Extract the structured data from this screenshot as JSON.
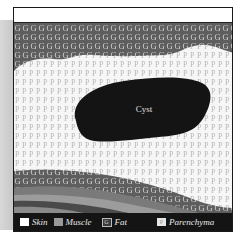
{
  "diagram": {
    "label_cyst": "Cyst",
    "fat_letter": "G",
    "parenchyma_letter": "P"
  },
  "legend": {
    "items": [
      {
        "label": "Skin",
        "color": "#ffffff"
      },
      {
        "label": "Muscle",
        "color": "#9a9a9a"
      },
      {
        "label": "Fat",
        "symbol": "G"
      },
      {
        "label": "Parenchyma",
        "symbol": "P"
      }
    ]
  },
  "colors": {
    "cyst": "#141414",
    "fat_bg": "#5e5e5e",
    "parenchyma_bg": "#f4f4f4",
    "muscle_light": "#8c8c8c",
    "muscle_dark": "#555555",
    "legend_bg": "#141414"
  }
}
